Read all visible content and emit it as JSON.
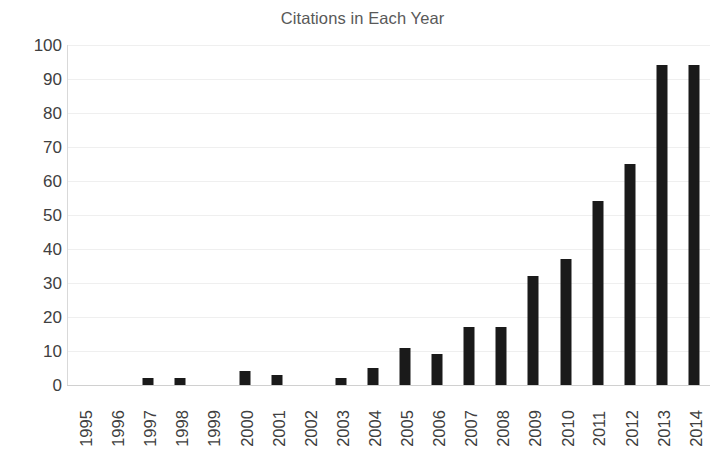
{
  "chart_data": {
    "type": "bar",
    "title": "Citations in Each Year",
    "xlabel": "",
    "ylabel": "",
    "categories": [
      "1995",
      "1996",
      "1997",
      "1998",
      "1999",
      "2000",
      "2001",
      "2002",
      "2003",
      "2004",
      "2005",
      "2006",
      "2007",
      "2008",
      "2009",
      "2010",
      "2011",
      "2012",
      "2013",
      "2014"
    ],
    "values": [
      0,
      0,
      2,
      2,
      0,
      4,
      3,
      0,
      2,
      5,
      11,
      9,
      17,
      17,
      32,
      37,
      54,
      65,
      94,
      94
    ],
    "ylim": [
      0,
      100
    ],
    "yticks": [
      "0",
      "10",
      "20",
      "30",
      "40",
      "50",
      "60",
      "70",
      "80",
      "90",
      "100"
    ],
    "grid": true,
    "legend": false,
    "bar_color": "#1a1a1a",
    "title_color": "#595959",
    "tick_color": "#404040",
    "gridline_color": "#efefef",
    "background": "#ffffff"
  }
}
